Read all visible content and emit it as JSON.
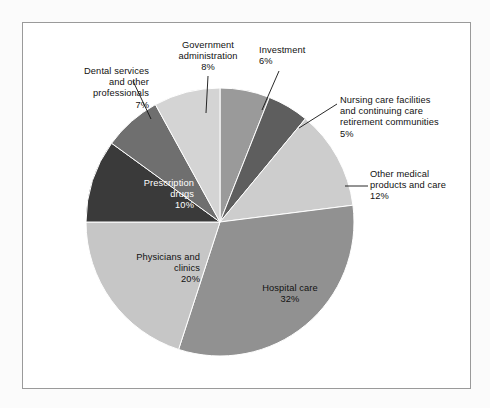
{
  "chart_data": {
    "type": "pie",
    "title": "",
    "subtitle": "",
    "xlabel": "",
    "ylabel": "",
    "legend_position": "none",
    "grid": false,
    "units": "percent",
    "total": 100,
    "start_angle_deg": -90,
    "direction": "clockwise",
    "categories": [
      "Investment",
      "Nursing care facilities and continuing care retirement communities",
      "Other medical products and care",
      "Hospital care",
      "Physicians and clinics",
      "Prescription drugs",
      "Dental services and other professionals",
      "Government administration"
    ],
    "values": [
      6,
      5,
      12,
      32,
      20,
      10,
      7,
      8
    ],
    "slices": [
      {
        "name": "Investment",
        "label_lines": "Investment\n6%",
        "value": 6,
        "value_text": "6%",
        "color": "#9a9a9a",
        "label_placement": "callout",
        "label_align": "left",
        "label_x": 259,
        "label_y": 45,
        "leader": {
          "x1": 279,
          "y1": 71,
          "x2": 262,
          "y2": 110
        }
      },
      {
        "name": "Nursing care facilities and continuing care retirement communities",
        "label_lines": "Nursing care facilities\nand continuing care\nretirement communities\n5%",
        "value": 5,
        "value_text": "5%",
        "color": "#5e5e5e",
        "label_placement": "callout",
        "label_align": "left",
        "label_x": 340,
        "label_y": 95,
        "leader": {
          "x1": 337,
          "y1": 104,
          "x2": 299,
          "y2": 128
        }
      },
      {
        "name": "Other medical products and care",
        "label_lines": "Other medical\nproducts and care\n12%",
        "value": 12,
        "value_text": "12%",
        "color": "#cdcdcd",
        "label_placement": "callout",
        "label_align": "left",
        "label_x": 370,
        "label_y": 169,
        "leader": {
          "x1": 368,
          "y1": 186,
          "x2": 345,
          "y2": 186
        }
      },
      {
        "name": "Hospital care",
        "label_lines": "Hospital care\n32%",
        "value": 32,
        "value_text": "32%",
        "color": "#919191",
        "label_placement": "inside",
        "label_align": "center",
        "label_x": 242,
        "label_y": 283,
        "text_color": "#111111"
      },
      {
        "name": "Physicians and clinics",
        "label_lines": "Physicians and\nclinics\n20%",
        "value": 20,
        "value_text": "20%",
        "color": "#c6c6c6",
        "label_placement": "inside",
        "label_align": "right",
        "label_x": 94,
        "label_y": 252,
        "text_color": "#111111"
      },
      {
        "name": "Prescription drugs",
        "label_lines": "Prescription\ndrugs\n10%",
        "value": 10,
        "value_text": "10%",
        "color": "#3a3a3a",
        "label_placement": "inside",
        "label_align": "right",
        "label_x": 88,
        "label_y": 178,
        "text_color": "#ffffff"
      },
      {
        "name": "Dental services and other professionals",
        "label_lines": "Dental services\nand other\nprofessionals\n7%",
        "value": 7,
        "value_text": "7%",
        "color": "#6f6f6f",
        "label_placement": "callout",
        "label_align": "right",
        "label_x": 43,
        "label_y": 66,
        "leader": {
          "x1": 133,
          "y1": 81,
          "x2": 151,
          "y2": 119
        }
      },
      {
        "name": "Government administration",
        "label_lines": "Government\nadministration\n8%",
        "value": 8,
        "value_text": "8%",
        "color": "#d4d4d4",
        "label_placement": "callout",
        "label_align": "center",
        "label_x": 160,
        "label_y": 40,
        "leader": {
          "x1": 208,
          "y1": 76,
          "x2": 206,
          "y2": 113
        }
      }
    ],
    "geometry": {
      "center_x": 220,
      "center_y": 222,
      "radius": 134
    }
  }
}
